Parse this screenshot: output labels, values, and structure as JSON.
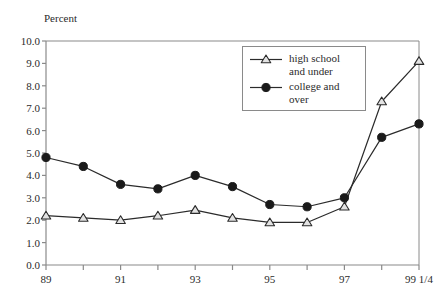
{
  "chart_data": {
    "type": "line",
    "title": "",
    "ylabel": "Percent",
    "xlabel": "",
    "ylim": [
      0.0,
      10.0
    ],
    "ytick_step": 1.0,
    "yticks": [
      "0.0",
      "1.0",
      "2.0",
      "3.0",
      "4.0",
      "5.0",
      "6.0",
      "7.0",
      "8.0",
      "9.0",
      "10.0"
    ],
    "grid": false,
    "legend_position": "upper-center-right",
    "categories": [
      "89",
      "90",
      "91",
      "92",
      "93",
      "94",
      "95",
      "96",
      "97",
      "98",
      "99 1/4"
    ],
    "xtick_labels_shown": [
      "89",
      "",
      "91",
      "",
      "93",
      "",
      "95",
      "",
      "97",
      "",
      "99 1/4"
    ],
    "series": [
      {
        "name": "high school and under",
        "marker": "triangle-open",
        "color": "#222222",
        "values": [
          2.2,
          2.1,
          2.0,
          2.2,
          2.45,
          2.1,
          1.9,
          1.9,
          2.6,
          7.3,
          9.1
        ]
      },
      {
        "name": "college and over",
        "marker": "circle-filled",
        "color": "#1a1a1a",
        "values": [
          4.8,
          4.4,
          3.6,
          3.4,
          4.0,
          3.5,
          2.7,
          2.6,
          3.0,
          5.7,
          6.3
        ]
      }
    ]
  },
  "legend": {
    "entries": [
      {
        "label_line1": "high school",
        "label_line2": "and under",
        "marker": "triangle-open"
      },
      {
        "label_line1": "college and",
        "label_line2": "over",
        "marker": "circle-filled"
      }
    ]
  },
  "axes": {
    "y_axis_title": "Percent"
  },
  "colors": {
    "axis": "#8a8a8a",
    "line": "#2b2b2b",
    "text": "#2b2b2b",
    "background": "#ffffff"
  }
}
